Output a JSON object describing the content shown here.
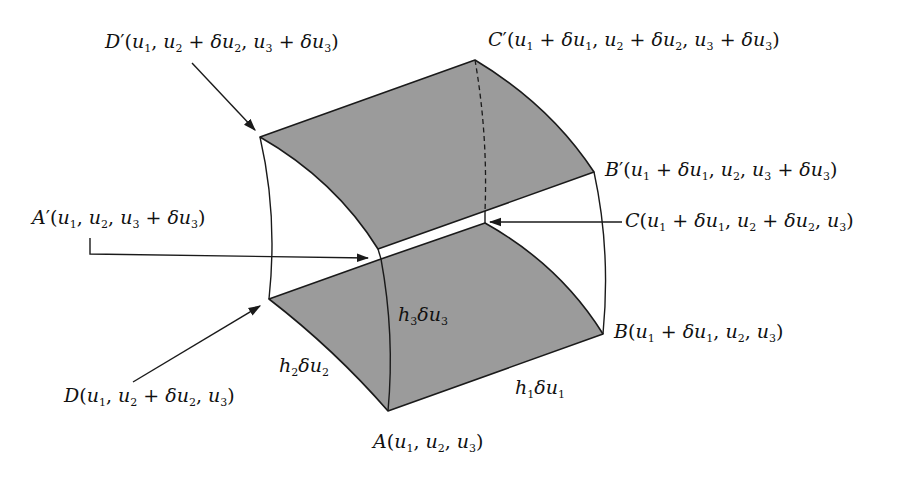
{
  "diagram": {
    "colors": {
      "face_fill": "#9b9b9b",
      "stroke": "#1a1a1a",
      "background": "#ffffff"
    },
    "vertices": {
      "A": {
        "name": "A",
        "coords": "(u1, u2, u3)",
        "x": 388,
        "y": 411
      },
      "B": {
        "name": "B",
        "coords": "(u1 + δu1, u2, u3)",
        "x": 603,
        "y": 334
      },
      "C": {
        "name": "C",
        "coords": "(u1 + δu1, u2 + δu2, u3)",
        "x": 485,
        "y": 223
      },
      "D": {
        "name": "D",
        "coords": "(u1, u2 + δu2, u3)",
        "x": 269,
        "y": 299
      },
      "A'": {
        "name": "A′",
        "coords": "(u1, u2, u3 + δu3)",
        "x": 381,
        "y": 259
      },
      "B'": {
        "name": "B′",
        "coords": "(u1 + δu1, u2, u3 + δu3)",
        "x": 594,
        "y": 172
      },
      "C'": {
        "name": "C′",
        "coords": "(u1 + δu1, u2 + δu2, u3 + δu3)",
        "x": 475,
        "y": 60
      },
      "D'": {
        "name": "D′",
        "coords": "(u1, u2 + δu2, u3 + δu3)",
        "x": 260,
        "y": 137
      }
    },
    "labels": {
      "D_prime": {
        "letter": "D",
        "prime": "′",
        "text": "D′(u₁, u₂ + δu₂, u₃ + δu₃)"
      },
      "C_prime": {
        "letter": "C",
        "prime": "′",
        "text": "C′(u₁ + δu₁, u₂ + δu₂, u₃ + δu₃)"
      },
      "B_prime": {
        "letter": "B",
        "prime": "′",
        "text": "B′(u₁ + δu₁, u₂, u₃ + δu₃)"
      },
      "A_prime": {
        "letter": "A",
        "prime": "′",
        "text": "A′(u₁, u₂, u₃ + δu₃)"
      },
      "C": {
        "letter": "C",
        "text": "C(u₁ + δu₁, u₂ + δu₂, u₃)"
      },
      "B": {
        "letter": "B",
        "text": "B(u₁ + δu₁, u₂, u₃)"
      },
      "D": {
        "letter": "D",
        "text": "D(u₁, u₂ + δu₂, u₃)"
      },
      "A": {
        "letter": "A",
        "text": "A(u₁, u₂, u₃)"
      }
    },
    "edge_lengths": {
      "h1": {
        "h": "h",
        "h_sub": "1",
        "du": "δu",
        "du_sub": "1",
        "text": "h₁δu₁"
      },
      "h2": {
        "h": "h",
        "h_sub": "2",
        "du": "δu",
        "du_sub": "2",
        "text": "h₂δu₂"
      },
      "h3": {
        "h": "h",
        "h_sub": "3",
        "du": "δu",
        "du_sub": "3",
        "text": "h₃δu₃"
      }
    },
    "arrows": [
      {
        "from_label": "D′",
        "to_vertex": "D′"
      },
      {
        "from_label": "A′",
        "to_vertex": "A′"
      },
      {
        "from_label": "C",
        "to_vertex": "C"
      },
      {
        "from_label": "D",
        "to_vertex": "D"
      }
    ],
    "sub": {
      "one": "1",
      "two": "2",
      "three": "3"
    },
    "sym": {
      "u": "u",
      "du": "δu",
      "plus": " + ",
      "comma": ", ",
      "open": "(",
      "close": ")"
    }
  }
}
